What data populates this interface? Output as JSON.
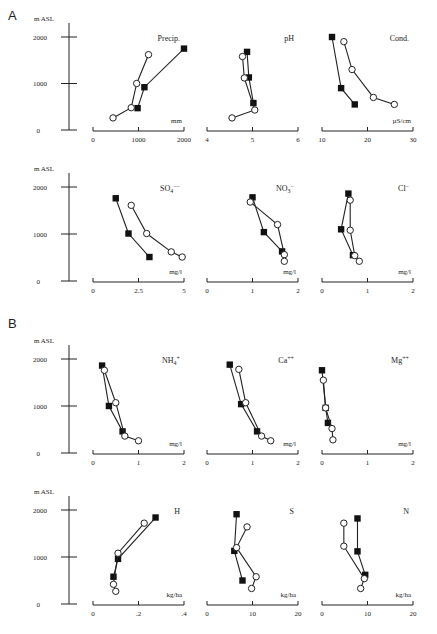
{
  "figure": {
    "sections": [
      {
        "label": "A",
        "x": 8,
        "y": 10
      },
      {
        "label": "B",
        "x": 8,
        "y": 318
      }
    ],
    "y_axis_label": "m ASL",
    "y_ticks": [
      "0",
      "1000",
      "2000"
    ]
  },
  "chart_data": [
    {
      "type": "line",
      "section": "A",
      "row": 0,
      "col": 0,
      "title": "Precip.",
      "xlabel": "mm",
      "ylabel": "m ASL",
      "xlim": [
        0,
        2000
      ],
      "ylim": [
        0,
        2000
      ],
      "x_ticks": [
        "0",
        "1000",
        "2000"
      ],
      "x_tick_values": [
        0,
        1000,
        2000
      ],
      "series": [
        {
          "name": "filled squares",
          "marker": "square-filled",
          "points": [
            [
              2000,
              1750
            ],
            [
              1130,
              920
            ],
            [
              980,
              470
            ]
          ]
        },
        {
          "name": "open circles",
          "marker": "circle-open",
          "points": [
            [
              1220,
              1620
            ],
            [
              960,
              1000
            ],
            [
              840,
              480
            ],
            [
              440,
              260
            ]
          ]
        }
      ]
    },
    {
      "type": "line",
      "section": "A",
      "row": 0,
      "col": 1,
      "title": "pH",
      "xlabel": "",
      "ylabel": "m ASL",
      "xlim": [
        4,
        6
      ],
      "ylim": [
        0,
        2000
      ],
      "x_ticks": [
        "4",
        "5",
        "6"
      ],
      "x_tick_values": [
        4,
        5,
        6
      ],
      "series": [
        {
          "name": "filled squares",
          "marker": "square-filled",
          "points": [
            [
              4.88,
              1680
            ],
            [
              4.92,
              1130
            ],
            [
              5.02,
              580
            ]
          ]
        },
        {
          "name": "open circles",
          "marker": "circle-open",
          "points": [
            [
              4.78,
              1580
            ],
            [
              4.82,
              1120
            ],
            [
              5.05,
              430
            ],
            [
              4.55,
              260
            ]
          ]
        }
      ]
    },
    {
      "type": "line",
      "section": "A",
      "row": 0,
      "col": 2,
      "title": "Cond.",
      "xlabel": "µS/cm",
      "ylabel": "m ASL",
      "xlim": [
        10,
        30
      ],
      "ylim": [
        0,
        2000
      ],
      "x_ticks": [
        "10",
        "20",
        "30"
      ],
      "x_tick_values": [
        10,
        20,
        30
      ],
      "series": [
        {
          "name": "filled squares",
          "marker": "square-filled",
          "points": [
            [
              12.2,
              2000
            ],
            [
              14.2,
              900
            ],
            [
              17.2,
              550
            ]
          ]
        },
        {
          "name": "open circles",
          "marker": "circle-open",
          "points": [
            [
              14.8,
              1900
            ],
            [
              16.6,
              1300
            ],
            [
              21.3,
              700
            ],
            [
              25.9,
              550
            ]
          ]
        }
      ]
    },
    {
      "type": "line",
      "section": "A",
      "row": 1,
      "col": 0,
      "title": "SO4--",
      "xlabel": "mg/l",
      "ylabel": "m ASL",
      "xlim": [
        0,
        5
      ],
      "ylim": [
        0,
        2000
      ],
      "x_ticks": [
        "0",
        "2.5",
        "5"
      ],
      "x_tick_values": [
        0,
        2.5,
        5
      ],
      "series": [
        {
          "name": "filled squares",
          "marker": "square-filled",
          "points": [
            [
              1.25,
              1760
            ],
            [
              1.95,
              1010
            ],
            [
              3.1,
              510
            ]
          ]
        },
        {
          "name": "open circles",
          "marker": "circle-open",
          "points": [
            [
              2.1,
              1610
            ],
            [
              2.95,
              1010
            ],
            [
              4.3,
              620
            ],
            [
              4.9,
              510
            ]
          ]
        }
      ]
    },
    {
      "type": "line",
      "section": "A",
      "row": 1,
      "col": 1,
      "title": "NO3-",
      "xlabel": "mg/l",
      "ylabel": "m ASL",
      "xlim": [
        0,
        2
      ],
      "ylim": [
        0,
        2000
      ],
      "x_ticks": [
        "0",
        "1",
        "2"
      ],
      "x_tick_values": [
        0,
        1,
        2
      ],
      "series": [
        {
          "name": "filled squares",
          "marker": "square-filled",
          "points": [
            [
              1.0,
              1780
            ],
            [
              1.25,
              1040
            ],
            [
              1.65,
              630
            ]
          ]
        },
        {
          "name": "open circles",
          "marker": "circle-open",
          "points": [
            [
              0.95,
              1680
            ],
            [
              1.55,
              1200
            ],
            [
              1.7,
              560
            ],
            [
              1.7,
              420
            ]
          ]
        }
      ]
    },
    {
      "type": "line",
      "section": "A",
      "row": 1,
      "col": 2,
      "title": "Cl-",
      "xlabel": "mg/l",
      "ylabel": "m ASL",
      "xlim": [
        0,
        2
      ],
      "ylim": [
        0,
        2000
      ],
      "x_ticks": [
        "0",
        "1",
        "2"
      ],
      "x_tick_values": [
        0,
        1,
        2
      ],
      "series": [
        {
          "name": "filled squares",
          "marker": "square-filled",
          "points": [
            [
              0.58,
              1860
            ],
            [
              0.42,
              1100
            ],
            [
              0.68,
              550
            ]
          ]
        },
        {
          "name": "open circles",
          "marker": "circle-open",
          "points": [
            [
              0.62,
              1720
            ],
            [
              0.62,
              1080
            ],
            [
              0.72,
              540
            ],
            [
              0.82,
              420
            ]
          ]
        }
      ]
    },
    {
      "type": "line",
      "section": "B",
      "row": 2,
      "col": 0,
      "title": "NH4+",
      "xlabel": "mg/l",
      "ylabel": "m ASL",
      "xlim": [
        0,
        2
      ],
      "ylim": [
        0,
        2000
      ],
      "x_ticks": [
        "0",
        "1",
        "2"
      ],
      "x_tick_values": [
        0,
        1,
        2
      ],
      "series": [
        {
          "name": "filled squares",
          "marker": "square-filled",
          "points": [
            [
              0.2,
              1860
            ],
            [
              0.35,
              1000
            ],
            [
              0.65,
              460
            ]
          ]
        },
        {
          "name": "open circles",
          "marker": "circle-open",
          "points": [
            [
              0.25,
              1760
            ],
            [
              0.5,
              1070
            ],
            [
              0.7,
              360
            ],
            [
              1.0,
              260
            ]
          ]
        }
      ]
    },
    {
      "type": "line",
      "section": "B",
      "row": 2,
      "col": 1,
      "title": "Ca++",
      "xlabel": "mg/l",
      "ylabel": "m ASL",
      "xlim": [
        0,
        2
      ],
      "ylim": [
        0,
        2000
      ],
      "x_ticks": [
        "0",
        "1",
        "2"
      ],
      "x_tick_values": [
        0,
        1,
        2
      ],
      "series": [
        {
          "name": "filled squares",
          "marker": "square-filled",
          "points": [
            [
              0.5,
              1880
            ],
            [
              0.75,
              1040
            ],
            [
              1.1,
              460
            ]
          ]
        },
        {
          "name": "open circles",
          "marker": "circle-open",
          "points": [
            [
              0.7,
              1780
            ],
            [
              0.85,
              1070
            ],
            [
              1.2,
              360
            ],
            [
              1.4,
              260
            ]
          ]
        }
      ]
    },
    {
      "type": "line",
      "section": "B",
      "row": 2,
      "col": 2,
      "title": "Mg++",
      "xlabel": "mg/l",
      "ylabel": "m ASL",
      "xlim": [
        0,
        2
      ],
      "ylim": [
        0,
        2000
      ],
      "x_ticks": [
        "0",
        "1",
        "2"
      ],
      "x_tick_values": [
        0,
        1,
        2
      ],
      "series": [
        {
          "name": "filled squares",
          "marker": "square-filled",
          "points": [
            [
              0.0,
              1760
            ],
            [
              0.08,
              960
            ],
            [
              0.13,
              640
            ]
          ]
        },
        {
          "name": "open circles",
          "marker": "circle-open",
          "points": [
            [
              0.03,
              1550
            ],
            [
              0.08,
              960
            ],
            [
              0.22,
              520
            ],
            [
              0.24,
              280
            ]
          ]
        }
      ]
    },
    {
      "type": "line",
      "section": "B",
      "row": 3,
      "col": 0,
      "title": "H",
      "xlabel": "kg/ha",
      "ylabel": "m ASL",
      "xlim": [
        0,
        0.4
      ],
      "ylim": [
        0,
        2000
      ],
      "x_ticks": [
        "0",
        ".2",
        ".4"
      ],
      "x_tick_values": [
        0,
        0.2,
        0.4
      ],
      "series": [
        {
          "name": "filled squares",
          "marker": "square-filled",
          "points": [
            [
              0.275,
              1840
            ],
            [
              0.11,
              960
            ],
            [
              0.09,
              580
            ]
          ]
        },
        {
          "name": "open circles",
          "marker": "circle-open",
          "points": [
            [
              0.225,
              1720
            ],
            [
              0.11,
              1080
            ],
            [
              0.09,
              420
            ],
            [
              0.1,
              270
            ]
          ]
        }
      ]
    },
    {
      "type": "line",
      "section": "B",
      "row": 3,
      "col": 1,
      "title": "S",
      "xlabel": "kg/ha",
      "ylabel": "m ASL",
      "xlim": [
        0,
        20
      ],
      "ylim": [
        0,
        2000
      ],
      "x_ticks": [
        "0",
        "10",
        "20"
      ],
      "x_tick_values": [
        0,
        10,
        20
      ],
      "series": [
        {
          "name": "filled squares",
          "marker": "square-filled",
          "points": [
            [
              6.5,
              1910
            ],
            [
              6.0,
              1130
            ],
            [
              7.8,
              500
            ]
          ]
        },
        {
          "name": "open circles",
          "marker": "circle-open",
          "points": [
            [
              8.8,
              1640
            ],
            [
              6.5,
              1200
            ],
            [
              10.8,
              580
            ],
            [
              9.8,
              330
            ]
          ]
        }
      ]
    },
    {
      "type": "line",
      "section": "B",
      "row": 3,
      "col": 2,
      "title": "N",
      "xlabel": "kg/ha",
      "ylabel": "m ASL",
      "xlim": [
        0,
        20
      ],
      "ylim": [
        0,
        2000
      ],
      "x_ticks": [
        "0",
        "10",
        "20"
      ],
      "x_tick_values": [
        0,
        10,
        20
      ],
      "series": [
        {
          "name": "filled squares",
          "marker": "square-filled",
          "points": [
            [
              7.8,
              1820
            ],
            [
              7.8,
              1120
            ],
            [
              9.5,
              620
            ]
          ]
        },
        {
          "name": "open circles",
          "marker": "circle-open",
          "points": [
            [
              4.8,
              1720
            ],
            [
              4.8,
              1230
            ],
            [
              9.3,
              540
            ],
            [
              8.5,
              330
            ]
          ]
        }
      ]
    }
  ],
  "layout": {
    "rows": [
      {
        "y0": 130,
        "y2000": 37,
        "yaxis_x": 69
      },
      {
        "y0": 281,
        "y2000": 187,
        "yaxis_x": 69
      },
      {
        "y0": 453,
        "y2000": 359,
        "yaxis_x": 69
      },
      {
        "y0": 604,
        "y2000": 510,
        "yaxis_x": 69
      }
    ],
    "cols": [
      {
        "x_start": 93,
        "x_end": 184
      },
      {
        "x_start": 207,
        "x_end": 298
      },
      {
        "x_start": 322,
        "x_end": 413
      }
    ]
  }
}
